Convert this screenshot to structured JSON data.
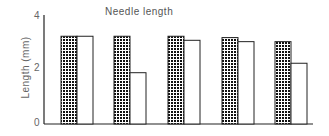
{
  "chart_data": {
    "type": "bar",
    "title": "Needle length",
    "xlabel": "",
    "ylabel": "Length (mm)",
    "ylim": [
      0,
      4
    ],
    "yticks": [
      0,
      2,
      4
    ],
    "categories": [
      "1",
      "2",
      "3",
      "4",
      "5"
    ],
    "series": [
      {
        "name": "Series A (checkered)",
        "pattern": "checkered",
        "values": [
          3.25,
          3.25,
          3.25,
          3.2,
          3.05
        ]
      },
      {
        "name": "Series B (open)",
        "pattern": "open",
        "values": [
          3.25,
          1.9,
          3.1,
          3.05,
          2.25
        ]
      }
    ],
    "grid": false,
    "legend": null
  },
  "labels": {
    "title": "Needle length",
    "ylabel": "Length (mm)",
    "ytick_0": "0",
    "ytick_2": "2",
    "ytick_4": "4"
  }
}
